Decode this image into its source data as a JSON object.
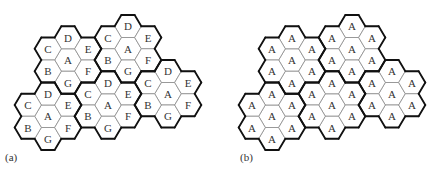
{
  "figure": {
    "panels": [
      {
        "id": "a",
        "label": "(a)",
        "offset_x": 0,
        "clusters": [
          {
            "center": [
              68,
              60
            ],
            "cells": {
              "A": "A",
              "B": "B",
              "C": "C",
              "D": "D",
              "E": "E",
              "F": "F",
              "G": "G"
            }
          },
          {
            "center": [
              128,
              48.75
            ],
            "cells": {
              "A": "A",
              "B": "B",
              "C": "C",
              "D": "D",
              "E": "E",
              "F": "F",
              "G": "G"
            }
          },
          {
            "center": [
              168,
              93.75
            ],
            "cells": {
              "A": "A",
              "B": "B",
              "C": "C",
              "D": "D",
              "E": "E",
              "F": "F",
              "G": "G"
            }
          },
          {
            "center": [
              48,
              116.25
            ],
            "cells": {
              "A": "A",
              "B": "B",
              "C": "C",
              "D": "D",
              "E": "E",
              "F": "F",
              "G": "G"
            }
          },
          {
            "center": [
              108,
              105
            ],
            "cells": {
              "A": "A",
              "B": "B",
              "C": "C",
              "D": "D",
              "E": "E",
              "F": "F",
              "G": "G"
            }
          }
        ]
      },
      {
        "id": "b",
        "label": "(b)",
        "offset_x": 224,
        "clusters": [
          {
            "center": [
              68,
              60
            ],
            "cells": {
              "A": "A",
              "B": "A",
              "C": "A",
              "D": "A",
              "E": "A",
              "F": "A",
              "G": "A"
            }
          },
          {
            "center": [
              128,
              48.75
            ],
            "cells": {
              "A": "A",
              "B": "A",
              "C": "A",
              "D": "A",
              "E": "A",
              "F": "A",
              "G": "A"
            }
          },
          {
            "center": [
              168,
              93.75
            ],
            "cells": {
              "A": "A",
              "B": "A",
              "C": "A",
              "D": "A",
              "E": "A",
              "F": "A",
              "G": "A"
            }
          },
          {
            "center": [
              48,
              116.25
            ],
            "cells": {
              "A": "A",
              "B": "A",
              "C": "A",
              "D": "A",
              "E": "A",
              "F": "A",
              "G": "A"
            }
          },
          {
            "center": [
              108,
              105
            ],
            "cells": {
              "A": "A",
              "B": "A",
              "C": "A",
              "D": "A",
              "E": "A",
              "F": "A",
              "G": "A"
            }
          }
        ]
      }
    ],
    "geometry": {
      "col_spacing": 20,
      "row_spacing": 22.5,
      "hex_half_width": 13.33
    },
    "colors": {
      "inner_edge": "#8a8a8a",
      "cluster_edge": "#111111",
      "text": "#333333",
      "background": "#ffffff"
    }
  },
  "labels": {
    "a": "(a)",
    "b": "(b)"
  }
}
